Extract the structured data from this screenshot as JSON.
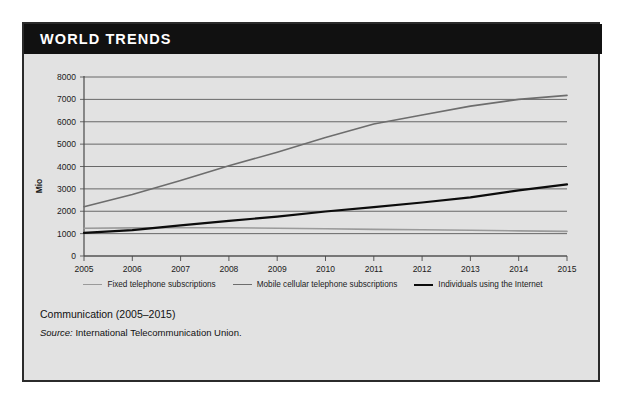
{
  "card": {
    "title": "WORLD TRENDS",
    "caption": "Communication (2005–2015)",
    "source_word": "Source:",
    "source_text": " International Telecommunication Union."
  },
  "colors": {
    "banner_bg": "#111111",
    "card_bg": "#e2e2e2",
    "border": "#2b2b2b",
    "fixed": "#9a9a9a",
    "mobile": "#6d6d6d",
    "internet": "#0c0c0c",
    "grid": "#5a5a5a"
  },
  "chart_data": {
    "type": "line",
    "title": "Communication (2005–2015)",
    "xlabel": "",
    "ylabel": "Mio",
    "x": [
      2005,
      2006,
      2007,
      2008,
      2009,
      2010,
      2011,
      2012,
      2013,
      2014,
      2015
    ],
    "xticklabels": [
      "2005",
      "2006",
      "2007",
      "2008",
      "2009",
      "2010",
      "2011",
      "2012",
      "2013",
      "2014",
      "2015"
    ],
    "yticklabels": [
      "0",
      "1000",
      "2000",
      "3000",
      "4000",
      "5000",
      "6000",
      "7000",
      "8000"
    ],
    "ylim": [
      0,
      8000
    ],
    "xlim": [
      2005,
      2015
    ],
    "ytick_step": 1000,
    "grid": true,
    "legend_position": "bottom",
    "series": [
      {
        "name": "Fixed telephone subscriptions",
        "color": "#9a9a9a",
        "values": [
          1240,
          1255,
          1265,
          1260,
          1240,
          1215,
          1190,
          1170,
          1150,
          1125,
          1100
        ]
      },
      {
        "name": "Mobile cellular telephone subscriptions",
        "color": "#6d6d6d",
        "values": [
          2205,
          2745,
          3370,
          4030,
          4640,
          5300,
          5900,
          6300,
          6700,
          7000,
          7180
        ]
      },
      {
        "name": "Individuals using the Internet",
        "color": "#0c0c0c",
        "values": [
          1030,
          1155,
          1370,
          1570,
          1760,
          1990,
          2180,
          2390,
          2620,
          2930,
          3200
        ]
      }
    ]
  }
}
